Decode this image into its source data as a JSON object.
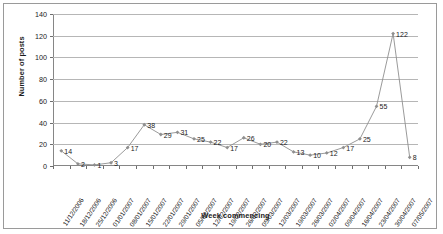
{
  "chart_data": {
    "type": "line",
    "title": "",
    "xlabel": "Week commencing",
    "ylabel": "Number of posts",
    "ylim": [
      0,
      140
    ],
    "ytick_step": 20,
    "yticks": [
      0,
      20,
      40,
      60,
      80,
      100,
      120,
      140
    ],
    "grid": true,
    "legend": "none",
    "show_data_labels": true,
    "series_color": "#8f8f8f",
    "marker": "diamond",
    "categories": [
      "11/12/2006",
      "18/12/2006",
      "25/12/2006",
      "01/01/2007",
      "08/01/2007",
      "15/01/2007",
      "22/01/2007",
      "29/01/2007",
      "05/02/2007",
      "12/02/2007",
      "19/02/2007",
      "26/02/2007",
      "05/03/2007",
      "12/03/2007",
      "19/03/2007",
      "26/03/2007",
      "02/04/2007",
      "09/04/2007",
      "16/04/2007",
      "23/04/2007",
      "30/04/2007",
      "07/05/2007"
    ],
    "values": [
      14,
      2,
      1,
      3,
      17,
      38,
      29,
      31,
      25,
      22,
      17,
      26,
      20,
      22,
      13,
      10,
      12,
      17,
      25,
      55,
      122,
      8
    ]
  }
}
